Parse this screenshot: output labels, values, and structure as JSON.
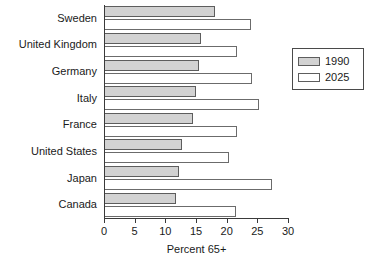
{
  "chart_data": {
    "type": "bar",
    "orientation": "horizontal",
    "title": "",
    "xlabel": "Percent 65+",
    "ylabel": "",
    "xlim": [
      0,
      30
    ],
    "xticks": [
      0,
      5,
      10,
      15,
      20,
      25,
      30
    ],
    "xtick_labels": [
      "0",
      "5",
      "10",
      "15",
      "20",
      "25",
      "30"
    ],
    "grid": false,
    "categories": [
      "Sweden",
      "United Kingdom",
      "Germany",
      "Italy",
      "France",
      "United States",
      "Japan",
      "Canada"
    ],
    "series": [
      {
        "name": "1990",
        "color": "#d2d2d2",
        "values": [
          17.9,
          15.6,
          15.4,
          14.9,
          14.3,
          12.6,
          12.0,
          11.5
        ]
      },
      {
        "name": "2025",
        "color": "#ffffff",
        "values": [
          23.8,
          21.6,
          24.0,
          25.1,
          21.5,
          20.2,
          27.3,
          21.3
        ]
      }
    ],
    "legend_position": "right"
  },
  "legend": {
    "items": [
      {
        "label": "1990",
        "swatch": "gray-swatch"
      },
      {
        "label": "2025",
        "swatch": "white-swatch"
      }
    ]
  },
  "axis": {
    "x_title": "Percent 65+"
  }
}
